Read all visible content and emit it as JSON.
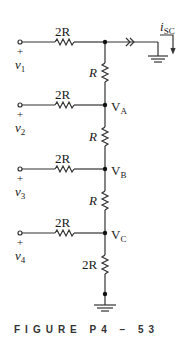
{
  "figure": {
    "caption": "FIGURE P4 – 53"
  },
  "sources": [
    {
      "sign": "+",
      "name": "v",
      "sub": "1",
      "resistor": "2R"
    },
    {
      "sign": "+",
      "name": "v",
      "sub": "2",
      "resistor": "2R"
    },
    {
      "sign": "+",
      "name": "v",
      "sub": "3",
      "resistor": "2R"
    },
    {
      "sign": "+",
      "name": "v",
      "sub": "4",
      "resistor": "2R"
    }
  ],
  "ladder": {
    "series_resistors": [
      "R",
      "R",
      "R"
    ],
    "bottom_resistor": "2R"
  },
  "nodes": [
    {
      "name": "V",
      "sub": "A"
    },
    {
      "name": "V",
      "sub": "B"
    },
    {
      "name": "V",
      "sub": "C"
    }
  ],
  "output": {
    "current_name": "i",
    "current_sub": "SC"
  },
  "colors": {
    "wire": "#333333",
    "text": "#1a1a1a"
  }
}
